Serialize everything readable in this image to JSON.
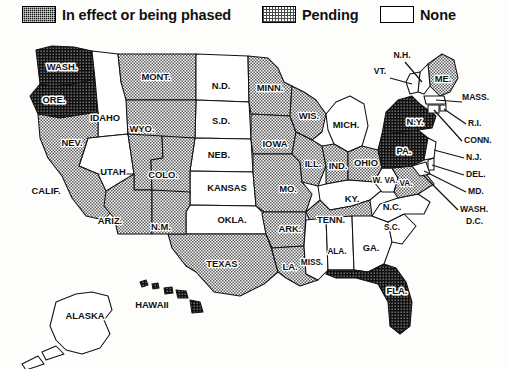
{
  "legend": {
    "title": "Status by state",
    "items": [
      {
        "key": "effect",
        "label": "In effect or being phased",
        "pattern": "dark-crosshatch",
        "color": "#111111"
      },
      {
        "key": "pending",
        "label": "Pending",
        "pattern": "gray-stipple",
        "color": "#9a9a9a"
      },
      {
        "key": "none",
        "label": "None",
        "pattern": "white",
        "color": "#ffffff"
      }
    ]
  },
  "map": {
    "projection": "usa-albers-schematic",
    "states": [
      {
        "abbr": "WASH.",
        "status": "effect",
        "label_x": 62,
        "label_y": 34,
        "label_style": "boxed"
      },
      {
        "abbr": "ORE.",
        "status": "effect",
        "label_x": 54,
        "label_y": 67,
        "label_style": "boxed"
      },
      {
        "abbr": "IDAHO",
        "status": "none",
        "label_x": 105,
        "label_y": 85,
        "label_style": "plain"
      },
      {
        "abbr": "MONT.",
        "status": "pending",
        "label_x": 156,
        "label_y": 44,
        "label_style": "plain"
      },
      {
        "abbr": "N.D.",
        "status": "none",
        "label_x": 221,
        "label_y": 53,
        "label_style": "plain"
      },
      {
        "abbr": "S.D.",
        "status": "none",
        "label_x": 221,
        "label_y": 88,
        "label_style": "plain"
      },
      {
        "abbr": "NEB.",
        "status": "none",
        "label_x": 219,
        "label_y": 122,
        "label_style": "plain"
      },
      {
        "abbr": "KANSAS",
        "status": "none",
        "label_x": 227,
        "label_y": 155,
        "label_style": "plain"
      },
      {
        "abbr": "OKLA.",
        "status": "none",
        "label_x": 232,
        "label_y": 187,
        "label_style": "plain"
      },
      {
        "abbr": "TEXAS",
        "status": "pending",
        "label_x": 222,
        "label_y": 231,
        "label_style": "plain"
      },
      {
        "abbr": "WYO.",
        "status": "pending",
        "label_x": 142,
        "label_y": 96,
        "label_style": "plain"
      },
      {
        "abbr": "NEV.",
        "status": "none",
        "label_x": 72,
        "label_y": 110,
        "label_style": "plain"
      },
      {
        "abbr": "UTAH",
        "status": "pending",
        "label_x": 113,
        "label_y": 139,
        "label_style": "plain"
      },
      {
        "abbr": "COLO.",
        "status": "pending",
        "label_x": 163,
        "label_y": 142,
        "label_style": "plain"
      },
      {
        "abbr": "CALIF.",
        "status": "pending",
        "label_x": 46,
        "label_y": 158,
        "label_style": "plain"
      },
      {
        "abbr": "ARIZ.",
        "status": "pending",
        "label_x": 110,
        "label_y": 188,
        "label_style": "plain"
      },
      {
        "abbr": "N.M.",
        "status": "pending",
        "label_x": 161,
        "label_y": 194,
        "label_style": "plain"
      },
      {
        "abbr": "MINN.",
        "status": "pending",
        "label_x": 270,
        "label_y": 55,
        "label_style": "plain"
      },
      {
        "abbr": "IOWA",
        "status": "pending",
        "label_x": 275,
        "label_y": 111,
        "label_style": "plain"
      },
      {
        "abbr": "MO.",
        "status": "pending",
        "label_x": 288,
        "label_y": 156,
        "label_style": "plain"
      },
      {
        "abbr": "ARK.",
        "status": "pending",
        "label_x": 290,
        "label_y": 196,
        "label_style": "plain"
      },
      {
        "abbr": "LA.",
        "status": "pending",
        "label_x": 290,
        "label_y": 234,
        "label_style": "plain"
      },
      {
        "abbr": "WIS.",
        "status": "pending",
        "label_x": 309,
        "label_y": 83,
        "label_style": "plain"
      },
      {
        "abbr": "ILL.",
        "status": "pending",
        "label_x": 313,
        "label_y": 131,
        "label_style": "plain"
      },
      {
        "abbr": "MICH.",
        "status": "none",
        "label_x": 346,
        "label_y": 92,
        "label_style": "plain"
      },
      {
        "abbr": "IND.",
        "status": "pending",
        "label_x": 338,
        "label_y": 133,
        "label_style": "plain"
      },
      {
        "abbr": "OHIO",
        "status": "pending",
        "label_x": 366,
        "label_y": 130,
        "label_style": "plain"
      },
      {
        "abbr": "KY.",
        "status": "none",
        "label_x": 352,
        "label_y": 166,
        "label_style": "plain"
      },
      {
        "abbr": "TENN.",
        "status": "pending",
        "label_x": 331,
        "label_y": 187,
        "label_style": "plain"
      },
      {
        "abbr": "MISS.",
        "status": "none",
        "label_x": 312,
        "label_y": 229,
        "label_style": "plain"
      },
      {
        "abbr": "ALA.",
        "status": "none",
        "label_x": 337,
        "label_y": 218,
        "label_style": "plain"
      },
      {
        "abbr": "GA.",
        "status": "none",
        "label_x": 371,
        "label_y": 215,
        "label_style": "plain"
      },
      {
        "abbr": "FLA.",
        "status": "effect",
        "label_x": 397,
        "label_y": 258,
        "label_style": "boxed"
      },
      {
        "abbr": "S.C.",
        "status": "none",
        "label_x": 392,
        "label_y": 194,
        "label_style": "plain"
      },
      {
        "abbr": "N.C.",
        "status": "none",
        "label_x": 392,
        "label_y": 174,
        "label_style": "plain"
      },
      {
        "abbr": "W. VA.",
        "status": "none",
        "label_x": 385,
        "label_y": 147,
        "label_style": "plain"
      },
      {
        "abbr": "VA.",
        "status": "pending",
        "label_x": 404,
        "label_y": 150,
        "label_style": "plain"
      },
      {
        "abbr": "PA.",
        "status": "effect",
        "label_x": 404,
        "label_y": 118,
        "label_style": "boxed"
      },
      {
        "abbr": "N.Y.",
        "status": "effect",
        "label_x": 415,
        "label_y": 89,
        "label_style": "boxed"
      },
      {
        "abbr": "ME.",
        "status": "pending",
        "label_x": 445,
        "label_y": 54,
        "label_style": "plain"
      },
      {
        "abbr": "ALASKA",
        "status": "none",
        "label_x": 85,
        "label_y": 283,
        "label_style": "plain"
      },
      {
        "abbr": "HAWAII",
        "status": "effect",
        "label_x": 152,
        "label_y": 272,
        "label_style": "plain"
      }
    ],
    "callouts": [
      {
        "abbr": "N.H.",
        "status": "none",
        "x": 402,
        "y": 22
      },
      {
        "abbr": "VT.",
        "status": "none",
        "x": 382,
        "y": 38
      },
      {
        "abbr": "MASS.",
        "status": "none",
        "x": 465,
        "y": 64
      },
      {
        "abbr": "R.I.",
        "status": "none",
        "x": 470,
        "y": 88
      },
      {
        "abbr": "CONN.",
        "status": "none",
        "x": 465,
        "y": 105
      },
      {
        "abbr": "N.J.",
        "status": "none",
        "x": 468,
        "y": 123
      },
      {
        "abbr": "DEL.",
        "status": "none",
        "x": 468,
        "y": 140
      },
      {
        "abbr": "MD.",
        "status": "none",
        "x": 470,
        "y": 157
      },
      {
        "abbr": "WASH.",
        "status": "none",
        "x": 463,
        "y": 174
      },
      {
        "abbr": "D.C.",
        "status": "none",
        "x": 469,
        "y": 186
      }
    ]
  },
  "counts": {
    "effect": 5,
    "pending": 21,
    "none": 25
  }
}
